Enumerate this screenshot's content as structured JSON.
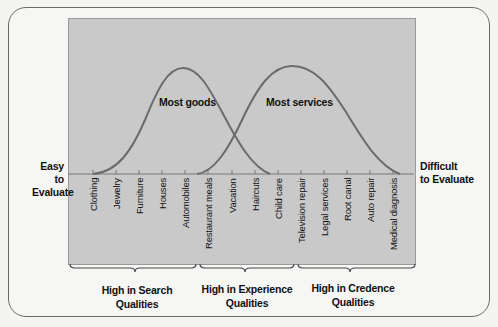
{
  "chart_data": {
    "type": "line",
    "title": "",
    "xlabel_left": "Easy to Evaluate",
    "xlabel_right": "Difficult to Evaluate",
    "categories": [
      "Clothing",
      "Jewelry",
      "Furniture",
      "Houses",
      "Automobiles",
      "Restaurant meals",
      "Vacation",
      "Haircuts",
      "Child care",
      "Television repair",
      "Legal services",
      "Root canal",
      "Auto repair",
      "Medical diagnosis"
    ],
    "series": [
      {
        "name": "Most goods",
        "shape": "bell curve",
        "peak_category": "Automobiles"
      },
      {
        "name": "Most services",
        "shape": "bell curve",
        "peak_category": "Television repair"
      }
    ],
    "groups": [
      {
        "label": "High in Search Qualities",
        "span": [
          "Clothing",
          "Automobiles"
        ]
      },
      {
        "label": "High in Experience Qualities",
        "span": [
          "Restaurant meals",
          "Child care"
        ]
      },
      {
        "label": "High in Credence Qualities",
        "span": [
          "Television repair",
          "Medical diagnosis"
        ]
      }
    ],
    "grid": false,
    "legend": "none (curves labeled inline)"
  },
  "labels": {
    "left_axis_line1": "Easy to",
    "left_axis_line2": "Evaluate",
    "right_axis_line1": "Difficult",
    "right_axis_line2": "to Evaluate",
    "goods": "Most goods",
    "services": "Most services"
  },
  "categories": [
    "Clothing",
    "Jewelry",
    "Furniture",
    "Houses",
    "Automobiles",
    "Restaurant meals",
    "Vacation",
    "Haircuts",
    "Child care",
    "Television repair",
    "Legal services",
    "Root canal",
    "Auto repair",
    "Medical diagnosis"
  ],
  "groups": [
    {
      "line1": "High in Search",
      "line2": "Qualities"
    },
    {
      "line1": "High in Experience",
      "line2": "Qualities"
    },
    {
      "line1": "High in Credence",
      "line2": "Qualities"
    }
  ],
  "colors": {
    "panel": "#c9c9c9",
    "curve": "#6b6b6b",
    "text": "#111111"
  }
}
